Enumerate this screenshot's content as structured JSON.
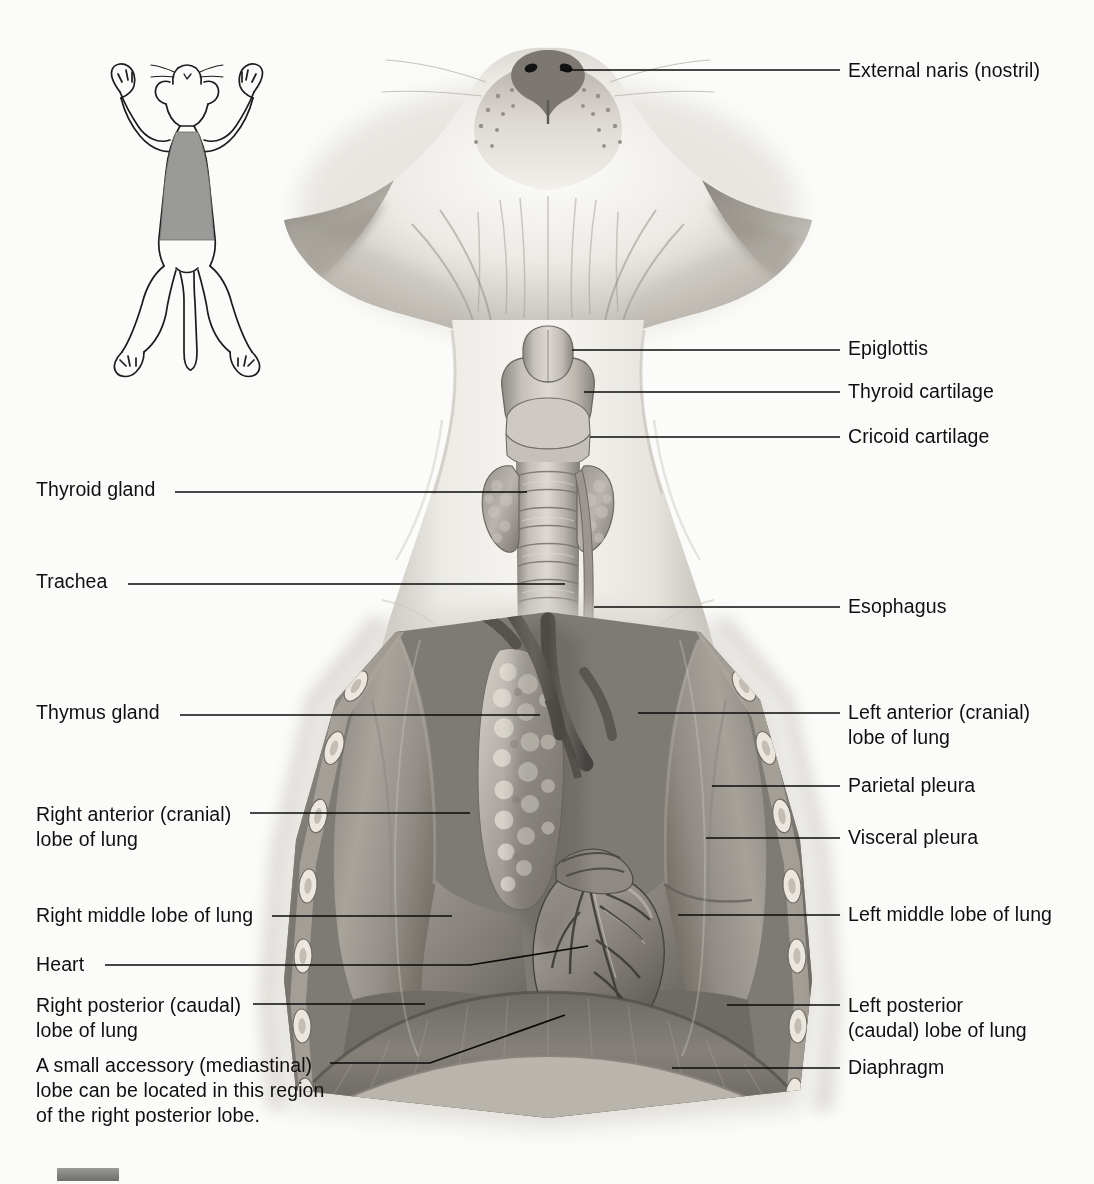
{
  "figure": {
    "subject": "cat",
    "view": "ventral (dorsal recumbency)",
    "background_color": "#fbfbf9",
    "label_text_color": "#100f0f",
    "leader_line_color": "#0b0b0b"
  },
  "inset": {
    "name": "orientation-inset",
    "description": "Whole cat in dorsal recumbency, limbs extended; shaded rectangle marks the thoracic region shown in the main illustration.",
    "shaded_region_color": "#9a9a98",
    "outline_color": "#1a1a1a"
  },
  "labels_left": [
    {
      "id": "thyroid-gland",
      "text": "Thyroid gland",
      "lines": [
        "Thyroid gland"
      ],
      "text_x": 36,
      "text_y": 477,
      "leader": {
        "x1": 175,
        "y1": 492,
        "x2": 527,
        "y2": 492
      }
    },
    {
      "id": "trachea",
      "text": "Trachea",
      "lines": [
        "Trachea"
      ],
      "text_x": 36,
      "text_y": 569,
      "leader": {
        "x1": 128,
        "y1": 584,
        "x2": 565,
        "y2": 584
      }
    },
    {
      "id": "thymus-gland",
      "text": "Thymus gland",
      "lines": [
        "Thymus gland"
      ],
      "text_x": 36,
      "text_y": 700,
      "leader": {
        "x1": 180,
        "y1": 715,
        "x2": 540,
        "y2": 715
      }
    },
    {
      "id": "right-anterior-lobe",
      "text": "Right anterior (cranial) lobe of lung",
      "lines": [
        "Right anterior (cranial)",
        "lobe of lung"
      ],
      "text_x": 36,
      "text_y": 802,
      "leader": {
        "x1": 250,
        "y1": 813,
        "x2": 470,
        "y2": 813
      }
    },
    {
      "id": "right-middle-lobe",
      "text": "Right middle lobe of lung",
      "lines": [
        "Right middle lobe of lung"
      ],
      "text_x": 36,
      "text_y": 903,
      "leader": {
        "x1": 272,
        "y1": 916,
        "x2": 452,
        "y2": 916
      }
    },
    {
      "id": "heart",
      "text": "Heart",
      "lines": [
        "Heart"
      ],
      "text_x": 36,
      "text_y": 952,
      "leader_poly": "105,965 470,965 588,946",
      "leader": {
        "x1": 105,
        "y1": 965,
        "x2": 588,
        "y2": 946
      }
    },
    {
      "id": "right-posterior-lobe",
      "text": "Right posterior (caudal) lobe of lung",
      "lines": [
        "Right posterior (caudal)",
        "lobe of lung"
      ],
      "text_x": 36,
      "text_y": 993,
      "leader": {
        "x1": 253,
        "y1": 1004,
        "x2": 425,
        "y2": 1004
      }
    },
    {
      "id": "accessory-lobe-note",
      "text": "A small accessory (mediastinal) lobe can be located in this region of the right posterior lobe.",
      "lines": [
        "A small accessory (mediastinal)",
        "lobe can be located in this region",
        "of the right posterior lobe."
      ],
      "text_x": 36,
      "text_y": 1053,
      "leader_poly": "330,1063 430,1063 565,1015",
      "leader": {
        "x1": 330,
        "y1": 1063,
        "x2": 565,
        "y2": 1015
      }
    }
  ],
  "labels_right": [
    {
      "id": "external-naris",
      "text": "External naris (nostril)",
      "lines": [
        "External naris (nostril)"
      ],
      "text_x": 848,
      "text_y": 58,
      "leader": {
        "x1": 560,
        "y1": 70,
        "x2": 840,
        "y2": 70
      }
    },
    {
      "id": "epiglottis",
      "text": "Epiglottis",
      "lines": [
        "Epiglottis"
      ],
      "text_x": 848,
      "text_y": 336,
      "leader": {
        "x1": 572,
        "y1": 350,
        "x2": 840,
        "y2": 350
      }
    },
    {
      "id": "thyroid-cartilage",
      "text": "Thyroid cartilage",
      "lines": [
        "Thyroid cartilage"
      ],
      "text_x": 848,
      "text_y": 379,
      "leader": {
        "x1": 584,
        "y1": 392,
        "x2": 840,
        "y2": 392
      }
    },
    {
      "id": "cricoid-cartilage",
      "text": "Cricoid cartilage",
      "lines": [
        "Cricoid cartilage"
      ],
      "text_x": 848,
      "text_y": 424,
      "leader": {
        "x1": 590,
        "y1": 437,
        "x2": 840,
        "y2": 437
      }
    },
    {
      "id": "esophagus",
      "text": "Esophagus",
      "lines": [
        "Esophagus"
      ],
      "text_x": 848,
      "text_y": 594,
      "leader": {
        "x1": 594,
        "y1": 607,
        "x2": 840,
        "y2": 607
      }
    },
    {
      "id": "left-anterior-lobe",
      "text": "Left anterior (cranial) lobe of lung",
      "lines": [
        "Left anterior (cranial)",
        "lobe of lung"
      ],
      "text_x": 848,
      "text_y": 700,
      "leader": {
        "x1": 638,
        "y1": 713,
        "x2": 840,
        "y2": 713
      }
    },
    {
      "id": "parietal-pleura",
      "text": "Parietal pleura",
      "lines": [
        "Parietal pleura"
      ],
      "text_x": 848,
      "text_y": 773,
      "leader": {
        "x1": 712,
        "y1": 786,
        "x2": 840,
        "y2": 786
      }
    },
    {
      "id": "visceral-pleura",
      "text": "Visceral pleura",
      "lines": [
        "Visceral pleura"
      ],
      "text_x": 848,
      "text_y": 825,
      "leader": {
        "x1": 706,
        "y1": 838,
        "x2": 840,
        "y2": 838
      }
    },
    {
      "id": "left-middle-lobe",
      "text": "Left middle lobe of lung",
      "lines": [
        "Left middle lobe of lung"
      ],
      "text_x": 848,
      "text_y": 902,
      "leader": {
        "x1": 678,
        "y1": 915,
        "x2": 840,
        "y2": 915
      }
    },
    {
      "id": "left-posterior-lobe",
      "text": "Left posterior (caudal) lobe of lung",
      "lines": [
        "Left posterior",
        "(caudal) lobe of lung"
      ],
      "text_x": 848,
      "text_y": 993,
      "leader": {
        "x1": 727,
        "y1": 1005,
        "x2": 840,
        "y2": 1005
      }
    },
    {
      "id": "diaphragm",
      "text": "Diaphragm",
      "lines": [
        "Diaphragm"
      ],
      "text_x": 848,
      "text_y": 1055,
      "leader": {
        "x1": 672,
        "y1": 1068,
        "x2": 840,
        "y2": 1068
      }
    }
  ],
  "anatomy_regions": [
    {
      "id": "head",
      "name": "Cat head, ventral view with ears and muzzle"
    },
    {
      "id": "larynx",
      "name": "Larynx with epiglottis, thyroid and cricoid cartilages"
    },
    {
      "id": "thyroid-gland-lobes",
      "name": "Paired thyroid gland lobes flanking the trachea"
    },
    {
      "id": "trachea-rings",
      "name": "Trachea with cartilage rings"
    },
    {
      "id": "esophagus-tube",
      "name": "Esophagus running alongside trachea"
    },
    {
      "id": "thymus",
      "name": "Lobulated thymus gland in cranial mediastinum"
    },
    {
      "id": "right-lung",
      "name": "Right lung: anterior, middle and posterior lobes"
    },
    {
      "id": "left-lung",
      "name": "Left lung: anterior, middle and posterior lobes"
    },
    {
      "id": "heart-organ",
      "name": "Heart with coronary vessels in pericardium"
    },
    {
      "id": "diaphragm-muscle",
      "name": "Diaphragm forming caudal wall of thorax"
    },
    {
      "id": "thoracic-wall",
      "name": "Cut thoracic wall with ribs, parietal pleura and intercostal muscles"
    }
  ]
}
